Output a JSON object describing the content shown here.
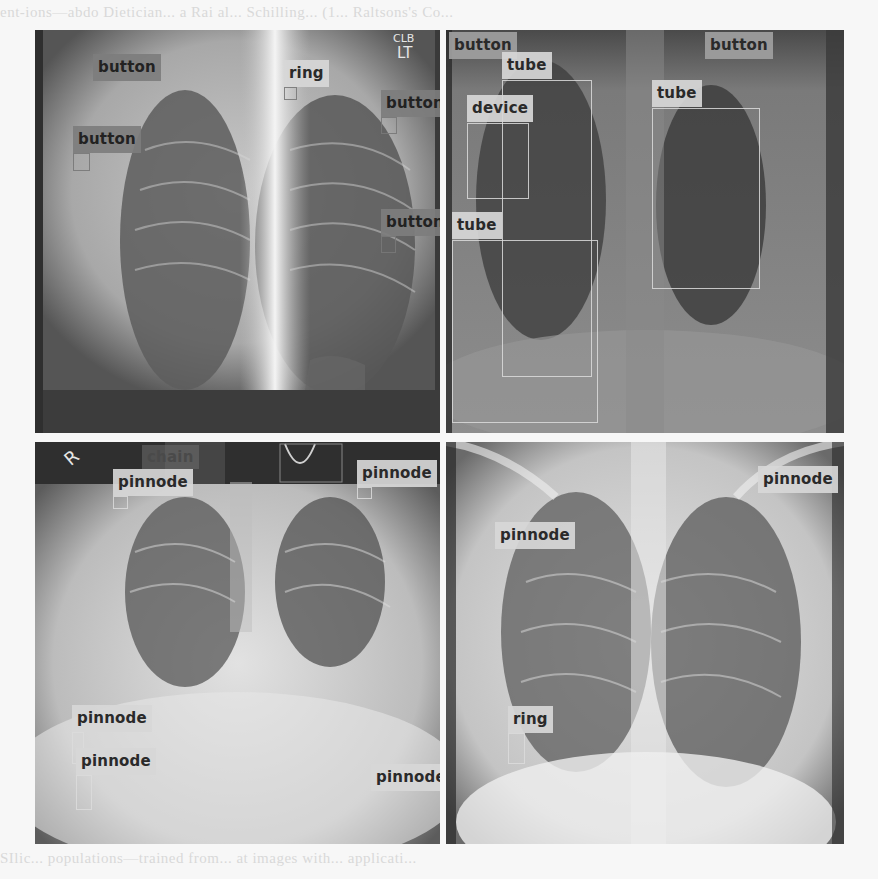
{
  "figure": {
    "background_text_top": "ent-ions—abdo Dietician... a Rai al... Schilling... (1... Raltsons's Co...",
    "background_text_bottom": "SIlic... populations—trained from... at images with... applicati..."
  },
  "panels": [
    {
      "id": "top-left",
      "markers": [
        "CLB",
        "LT"
      ],
      "detections": [
        {
          "label": "button",
          "style": "mid"
        },
        {
          "label": "ring",
          "style": "light"
        },
        {
          "label": "button",
          "style": "mid"
        },
        {
          "label": "button",
          "style": "mid"
        },
        {
          "label": "button",
          "style": "mid"
        }
      ]
    },
    {
      "id": "top-right",
      "detections": [
        {
          "label": "button",
          "style": "grey"
        },
        {
          "label": "tube",
          "style": "light"
        },
        {
          "label": "device",
          "style": "light"
        },
        {
          "label": "tube",
          "style": "light"
        },
        {
          "label": "tube",
          "style": "light"
        },
        {
          "label": "button",
          "style": "grey"
        }
      ]
    },
    {
      "id": "bottom-left",
      "markers": [
        "R"
      ],
      "detections": [
        {
          "label": "chain",
          "style": "faint"
        },
        {
          "label": "pinnode",
          "style": "light"
        },
        {
          "label": "pinnode",
          "style": "light"
        },
        {
          "label": "pinnode",
          "style": "light"
        },
        {
          "label": "pinnode",
          "style": "light"
        },
        {
          "label": "pinnode",
          "style": "light"
        }
      ]
    },
    {
      "id": "bottom-right",
      "detections": [
        {
          "label": "pinnode",
          "style": "light"
        },
        {
          "label": "pinnode",
          "style": "light"
        },
        {
          "label": "ring",
          "style": "light"
        }
      ]
    }
  ]
}
